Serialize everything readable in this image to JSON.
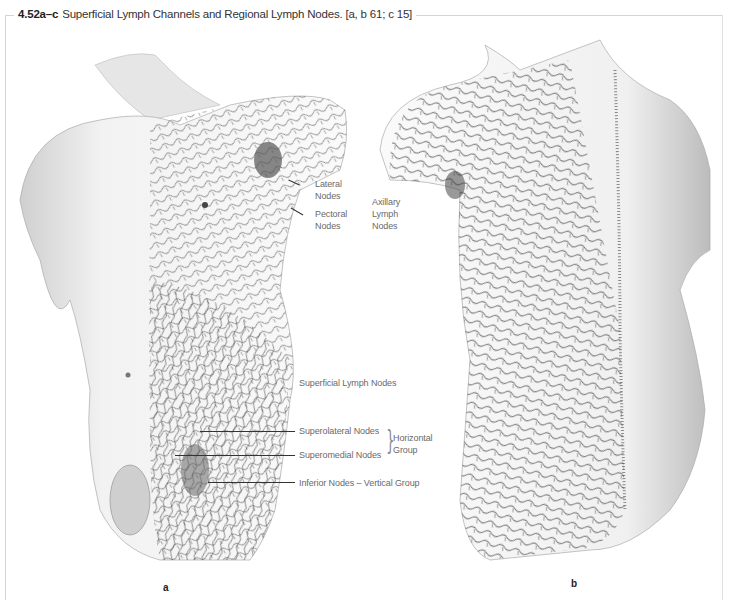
{
  "figure": {
    "number": "4.52a–c",
    "title": "Superficial Lymph Channels and Regional Lymph Nodes. [a, b 61; c 15]"
  },
  "panels": [
    {
      "id": "a",
      "label": "a",
      "view": "anterior trunk"
    },
    {
      "id": "b",
      "label": "b",
      "view": "posterior trunk"
    }
  ],
  "labels": {
    "lateral_nodes": "Lateral\nNodes",
    "lateral_nodes_1": "Lateral",
    "lateral_nodes_2": "Nodes",
    "pectoral_nodes_1": "Pectoral",
    "pectoral_nodes_2": "Nodes",
    "axillary_1": "Axillary",
    "axillary_2": "Lymph",
    "axillary_3": "Nodes",
    "superficial_lymph_nodes": "Superficial Lymph Nodes",
    "superolateral_nodes": "Superolateral Nodes",
    "superomedial_nodes": "Superomedial Nodes",
    "horizontal_group_1": "Horizontal",
    "horizontal_group_2": "Group",
    "inferior_nodes": "Inferior Nodes – Vertical Group"
  },
  "colors": {
    "frame": "#d4d4d4",
    "label_text": "#6a6a6a",
    "title_text": "#333333",
    "lymph_lines": "#2a2a2a",
    "skin_shade": "#d8d8d8"
  }
}
